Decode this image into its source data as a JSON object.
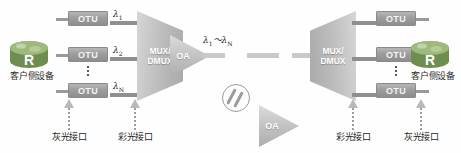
{
  "diagram": {
    "colors": {
      "device_fill": "#9d9d9d",
      "mux_fill": "#bdbdbd",
      "trunk": "#c9c9c9",
      "router_green": "#7a9a5b",
      "text": "#1f1f1f"
    },
    "left_side": {
      "client_device": {
        "icon": "router-icon",
        "badge": "R",
        "label": "客户侧设备"
      },
      "otu_rows": [
        {
          "otu_label": "OTU",
          "lambda_base": "λ",
          "lambda_sub": "1"
        },
        {
          "otu_label": "OTU",
          "lambda_base": "λ",
          "lambda_sub": "2"
        },
        {
          "otu_label": "OTU",
          "lambda_base": "λ",
          "lambda_sub": "N"
        }
      ],
      "mux": {
        "line1": "MUX/",
        "line2": "DMUX"
      },
      "amplifier": {
        "label": "OA"
      },
      "callouts": [
        {
          "text": "灰光接口"
        },
        {
          "text": "彩光接口"
        }
      ]
    },
    "span": {
      "lambda_range_prefix": "λ",
      "lambda_range_sub1": "1",
      "lambda_range_tilde": "～",
      "lambda_range_base2": "λ",
      "lambda_range_sub2": "N",
      "fiber_icon": "fiber-spool-icon"
    },
    "right_side": {
      "amplifier": {
        "label": "OA"
      },
      "mux": {
        "line1": "MUX/",
        "line2": "DMUX"
      },
      "otu_rows": [
        {
          "otu_label": "OTU"
        },
        {
          "otu_label": "OTU"
        },
        {
          "otu_label": "OTU"
        }
      ],
      "client_device": {
        "icon": "router-icon",
        "badge": "R",
        "label": "客户侧设备"
      },
      "callouts": [
        {
          "text": "彩光接口"
        },
        {
          "text": "灰光接口"
        }
      ]
    }
  }
}
